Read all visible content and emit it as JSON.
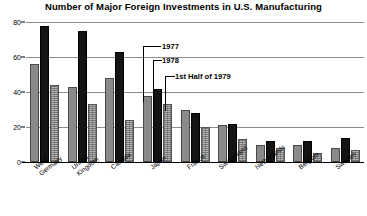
{
  "chart_data": {
    "type": "bar",
    "title": "Number of Major Foreign Investments in U.S. Manufacturing",
    "xlabel": "",
    "ylabel": "",
    "ylim": [
      0,
      80
    ],
    "yticks": [
      0,
      20,
      40,
      60,
      80
    ],
    "grid": true,
    "legend_position": "inline-callout",
    "categories": [
      "West\nGermany",
      "United\nKingdom",
      "Canada",
      "Japan",
      "France",
      "Switzerland",
      "Netherlands",
      "Belgium",
      "Sweden"
    ],
    "series": [
      {
        "name": "1977",
        "color": "#8a8a8a",
        "values": [
          56,
          43,
          48,
          38,
          30,
          21,
          10,
          10,
          8
        ]
      },
      {
        "name": "1978",
        "color": "#141414",
        "values": [
          78,
          75,
          63,
          42,
          28,
          22,
          12,
          12,
          14
        ]
      },
      {
        "name": "1st Half of 1979",
        "color": "#b9b9b9",
        "values": [
          44,
          33,
          24,
          33,
          20,
          13,
          8,
          5,
          7
        ]
      }
    ],
    "annotations": [
      {
        "text": "1977",
        "target_group": "Japan",
        "target_series": "1977"
      },
      {
        "text": "1978",
        "target_group": "Japan",
        "target_series": "1978"
      },
      {
        "text": "1st Half of 1979",
        "target_group": "Japan",
        "target_series": "1st Half of 1979"
      }
    ]
  }
}
